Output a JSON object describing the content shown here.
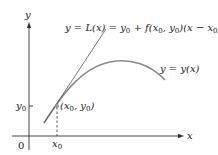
{
  "diagram": {
    "axes": {
      "y_label": "y",
      "x_label": "x",
      "origin_label": "0",
      "x0_label": "x",
      "x0_sub": "0",
      "y0_label": "y",
      "y0_sub": "0"
    },
    "point": {
      "open": "(x",
      "sub1": "0",
      "mid": ", y",
      "sub2": "0",
      "close": ")"
    },
    "tangent_label": {
      "part1": "y = L(x) = y",
      "sub1": "0",
      "part2": " + f(x",
      "sub2": "0",
      "part3": ", y",
      "sub3": "0",
      "part4": ")(x − x",
      "sub4": "0",
      "part5": ")"
    },
    "curve_label": "y = y(x)",
    "colors": {
      "axis": "#333333",
      "curve": "#8a8a8a",
      "tangent": "#555555",
      "point": "#9a9a9a",
      "text": "#222222"
    }
  }
}
